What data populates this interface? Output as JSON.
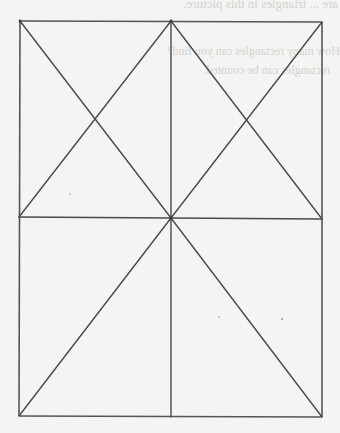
{
  "figure": {
    "stroke_color": "#4a4a4a",
    "background_color": "#f4f4f2",
    "vertices": {
      "top_left": [
        20,
        21
      ],
      "top_mid": [
        171,
        21
      ],
      "top_right": [
        322,
        22
      ],
      "mid_left": [
        19,
        217
      ],
      "center": [
        171,
        218
      ],
      "mid_right": [
        322,
        219
      ],
      "bottom_left": [
        19,
        416
      ],
      "bottom_mid": [
        171,
        417
      ],
      "bottom_right": [
        322,
        417
      ]
    },
    "segments": [
      {
        "name": "top-edge",
        "from": "top_left",
        "to": "top_right"
      },
      {
        "name": "bottom-edge",
        "from": "bottom_left",
        "to": "bottom_right"
      },
      {
        "name": "left-edge",
        "from": "top_left",
        "to": "bottom_left"
      },
      {
        "name": "right-edge",
        "from": "top_right",
        "to": "bottom_right"
      },
      {
        "name": "vertical-midline",
        "from": "top_mid",
        "to": "bottom_mid"
      },
      {
        "name": "horizontal-midline",
        "from": "mid_left",
        "to": "mid_right"
      },
      {
        "name": "upper-left-diagonal-a",
        "from": "top_left",
        "to": "center"
      },
      {
        "name": "upper-left-diagonal-b",
        "from": "top_mid",
        "to": "mid_left"
      },
      {
        "name": "upper-right-diagonal-a",
        "from": "top_mid",
        "to": "mid_right"
      },
      {
        "name": "upper-right-diagonal-b",
        "from": "top_right",
        "to": "center"
      },
      {
        "name": "lower-left-diagonal",
        "from": "center",
        "to": "bottom_left"
      },
      {
        "name": "lower-right-diagonal",
        "from": "center",
        "to": "bottom_right"
      }
    ]
  },
  "bleed_through_text": {
    "line1": "are ... triangles in this picture.",
    "line2": "How many rectangles can you find?",
    "line3": "rectangles can be counted."
  }
}
